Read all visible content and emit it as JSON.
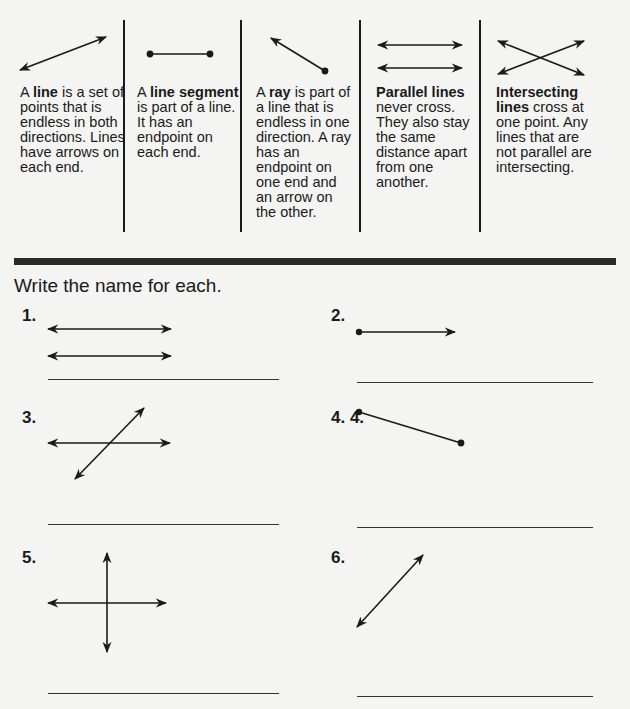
{
  "definitions": [
    {
      "prefix": "A ",
      "term": "line",
      "rest": " is a set of points that is endless in both directions. Lines have arrows on each end."
    },
    {
      "prefix": "A ",
      "term": "line segment",
      "rest": " is part of a line. It has an endpoint on each end."
    },
    {
      "prefix": "A ",
      "term": "ray",
      "rest": " is part of a line that is endless in one direction. A ray has an endpoint on one end and an arrow on the other."
    },
    {
      "prefix": "",
      "term": "Parallel lines",
      "rest": " never cross. They also stay the same distance apart from one another."
    },
    {
      "prefix": "",
      "term": "Intersecting lines",
      "rest": " cross at one point. Any lines that are not parallel are intersecting."
    }
  ],
  "exercise": {
    "instruction": "Write the name for each.",
    "items": [
      {
        "number": "1.",
        "figure": "parallel-lines"
      },
      {
        "number": "2.",
        "figure": "ray"
      },
      {
        "number": "3.",
        "figure": "intersecting-lines"
      },
      {
        "number": "4. 4.",
        "figure": "line-segment"
      },
      {
        "number": "5.",
        "figure": "perpendicular-intersecting-lines"
      },
      {
        "number": "6.",
        "figure": "line"
      }
    ]
  }
}
